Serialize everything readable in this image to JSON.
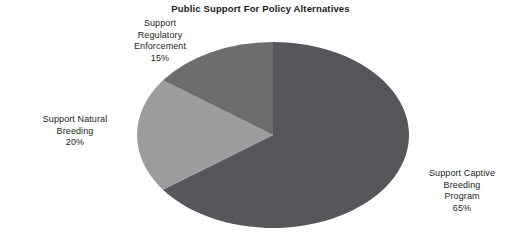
{
  "chart_data": {
    "type": "pie",
    "title": "Public Support For Policy Alternatives",
    "xlabel": "",
    "ylabel": "",
    "legend": "none",
    "grid": false,
    "start_angle_deg": 90,
    "direction": "clockwise",
    "categories": [
      "Support Captive Breeding Program",
      "Support Natural Breeding",
      "Support Regulatory Enforcement"
    ],
    "values": [
      65,
      20,
      15
    ],
    "value_suffix": "%",
    "slices": [
      {
        "label": "Support Captive Breeding Program",
        "label_lines": [
          "Support Captive",
          "Breeding",
          "Program"
        ],
        "value": 65,
        "value_text": "65%",
        "color": "#55575a"
      },
      {
        "label": "Support Natural Breeding",
        "label_lines": [
          "Support Natural",
          "Breeding"
        ],
        "value": 20,
        "value_text": "20%",
        "color": "#9b9c9e"
      },
      {
        "label": "Support Regulatory Enforcement",
        "label_lines": [
          "Support",
          "Regulatory",
          "Enforcement"
        ],
        "value": 15,
        "value_text": "15%",
        "color": "#6b6d6f"
      }
    ]
  },
  "title": "Public Support For Policy Alternatives",
  "labels": {
    "regulatory": {
      "line1": "Support",
      "line2": "Regulatory",
      "line3": "Enforcement",
      "value": "15%"
    },
    "natural": {
      "line1": "Support Natural",
      "line2": "Breeding",
      "value": "20%"
    },
    "captive": {
      "line1": "Support Captive",
      "line2": "Breeding",
      "line3": "Program",
      "value": "65%"
    }
  },
  "colors": {
    "background": "#ffffff",
    "text": "#231f20",
    "slice_captive": "#55575a",
    "slice_natural": "#9b9c9e",
    "slice_regulatory": "#6b6d6f"
  }
}
